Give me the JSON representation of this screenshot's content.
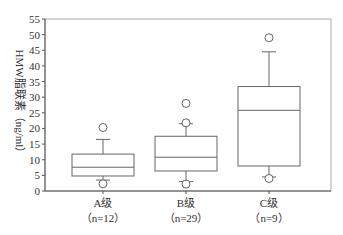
{
  "chart_data": {
    "type": "box",
    "title": "",
    "xlabel": "",
    "ylabel": "HMW脂联素（ng/ml）",
    "ylim": [
      0,
      55
    ],
    "yticks": [
      0,
      5,
      10,
      15,
      20,
      25,
      30,
      35,
      40,
      45,
      50,
      55
    ],
    "grid": false,
    "legend": null,
    "categories": [
      {
        "label": "A级",
        "n_label": "（n=12）",
        "n": 12
      },
      {
        "label": "B级",
        "n_label": "（n=29）",
        "n": 29
      },
      {
        "label": "C级",
        "n_label": "（n=9）",
        "n": 9
      }
    ],
    "series": [
      {
        "name": "A级",
        "whisker_low": 3.5,
        "q1": 4.8,
        "median": 7.6,
        "q3": 11.8,
        "whisker_high": 16.5,
        "outliers": [
          20.3,
          2.3
        ]
      },
      {
        "name": "B级",
        "whisker_low": 3.0,
        "q1": 6.4,
        "median": 10.8,
        "q3": 17.5,
        "whisker_high": 21.5,
        "outliers": [
          28.0,
          21.8,
          2.2
        ]
      },
      {
        "name": "C级",
        "whisker_low": 4.5,
        "q1": 8.0,
        "median": 25.8,
        "q3": 33.4,
        "whisker_high": 44.5,
        "outliers": [
          49.0,
          4.0
        ]
      }
    ]
  },
  "colors": {
    "axis": "#555555",
    "box": "#666666",
    "text": "#333333"
  }
}
